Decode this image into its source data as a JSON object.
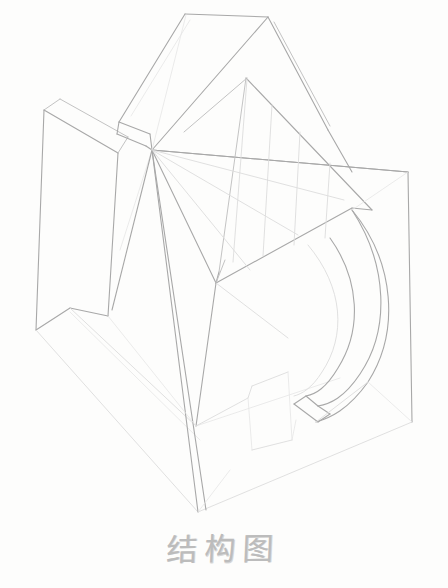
{
  "sheet": {
    "width": 448,
    "height": 588,
    "paper_color": "#fdfdfc",
    "medium": "pencil-on-paper",
    "title_visible": true
  },
  "caption": {
    "text": "结构图",
    "meaning": "structure drawing",
    "color": "#b9b9b9",
    "position": "bottom-center"
  },
  "drawing": {
    "subject": "geometric-structural-still-life",
    "style": "light-pencil-line-drawing",
    "stroke_color": "#c2c2c2",
    "stroke_color_dark": "#a9a9a9",
    "stroke_color_faint": "#dcdcdc",
    "parts": [
      {
        "name": "outer-box-frame",
        "label": "outer box frame"
      },
      {
        "name": "left-vertical-slab",
        "label": "left vertical slab"
      },
      {
        "name": "top-angled-plate",
        "label": "top angled plate"
      },
      {
        "name": "diagonal-band",
        "label": "diagonal band"
      },
      {
        "name": "curved-arc-band",
        "label": "curved arc band"
      },
      {
        "name": "radiating-construction-lines",
        "label": "radiating construction lines"
      },
      {
        "name": "lower-wedge",
        "label": "lower wedge"
      }
    ],
    "geometry": {
      "central_vertex": [
        152,
        150
      ],
      "bottom_vertex": [
        198,
        512
      ],
      "box_top_right": [
        408,
        172
      ],
      "box_bottom_right": [
        412,
        422
      ],
      "box_left_top": [
        44,
        110
      ],
      "box_left_bottom": [
        38,
        330
      ]
    }
  }
}
